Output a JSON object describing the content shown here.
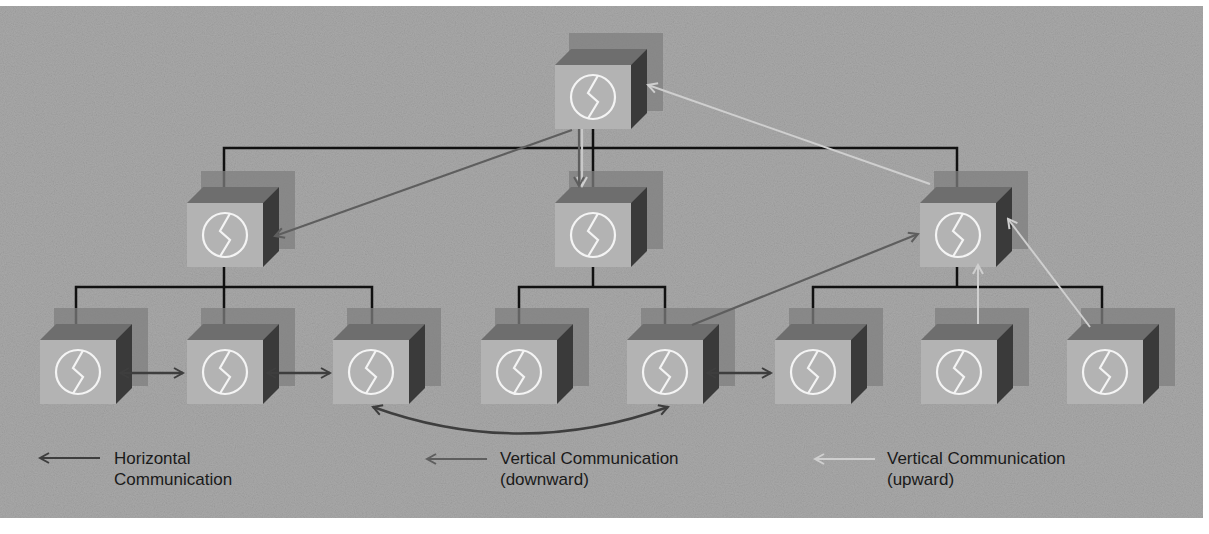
{
  "diagram": {
    "colors": {
      "background_panel": "#a9a9a9",
      "box_front": "#b4b4b4",
      "box_top": "#6e6e6e",
      "box_side": "#3c3c3c",
      "box_shadow": "#7d7d7d",
      "hierarchy_line": "#111111",
      "horizontal_arrow": "#3e3e3e",
      "downward_arrow": "#5e5e5e",
      "upward_arrow": "#c8c8c8",
      "icon_stroke": "#f4f4f4"
    },
    "nodes": [
      {
        "id": "top",
        "level": 0,
        "x": 555,
        "y": 65,
        "icon": "circle-zigzag-icon"
      },
      {
        "id": "mid-left",
        "level": 1,
        "x": 187,
        "y": 203,
        "icon": "circle-zigzag-icon"
      },
      {
        "id": "mid-center",
        "level": 1,
        "x": 555,
        "y": 203,
        "icon": "circle-zigzag-icon"
      },
      {
        "id": "mid-right",
        "level": 1,
        "x": 920,
        "y": 203,
        "icon": "circle-zigzag-icon"
      },
      {
        "id": "bottom-1",
        "level": 2,
        "x": 40,
        "y": 340,
        "icon": "circle-zigzag-icon"
      },
      {
        "id": "bottom-2",
        "level": 2,
        "x": 187,
        "y": 340,
        "icon": "circle-zigzag-icon"
      },
      {
        "id": "bottom-3",
        "level": 2,
        "x": 333,
        "y": 340,
        "icon": "circle-zigzag-icon"
      },
      {
        "id": "bottom-4",
        "level": 2,
        "x": 481,
        "y": 340,
        "icon": "circle-zigzag-icon"
      },
      {
        "id": "bottom-5",
        "level": 2,
        "x": 627,
        "y": 340,
        "icon": "circle-zigzag-icon"
      },
      {
        "id": "bottom-6",
        "level": 2,
        "x": 775,
        "y": 340,
        "icon": "circle-zigzag-icon"
      },
      {
        "id": "bottom-7",
        "level": 2,
        "x": 921,
        "y": 340,
        "icon": "circle-zigzag-icon"
      },
      {
        "id": "bottom-8",
        "level": 2,
        "x": 1067,
        "y": 340,
        "icon": "circle-zigzag-icon"
      }
    ],
    "communication": [
      {
        "type": "horizontal",
        "from": "bottom-1",
        "to": "bottom-2"
      },
      {
        "type": "horizontal",
        "from": "bottom-2",
        "to": "bottom-3"
      },
      {
        "type": "horizontal",
        "from": "bottom-5",
        "to": "bottom-6"
      },
      {
        "type": "horizontal",
        "from": "bottom-3",
        "to": "bottom-5",
        "shape": "curved"
      },
      {
        "type": "downward",
        "from": "top",
        "to": "mid-left"
      },
      {
        "type": "downward",
        "from": "top",
        "to": "mid-center"
      },
      {
        "type": "upward",
        "from": "mid-right",
        "to": "top"
      },
      {
        "type": "upward",
        "from": "bottom-5",
        "to": "mid-right"
      },
      {
        "type": "upward",
        "from": "bottom-7",
        "to": "mid-right"
      },
      {
        "type": "upward",
        "from": "bottom-8",
        "to": "mid-right"
      }
    ]
  },
  "legend": {
    "horizontal": {
      "label": "Horizontal\nCommunication",
      "icon": "arrow-left-dark-icon"
    },
    "downward": {
      "label": "Vertical Communication\n(downward)",
      "icon": "arrow-left-medium-icon"
    },
    "upward": {
      "label": "Vertical Communication\n(upward)",
      "icon": "arrow-left-light-icon"
    }
  }
}
